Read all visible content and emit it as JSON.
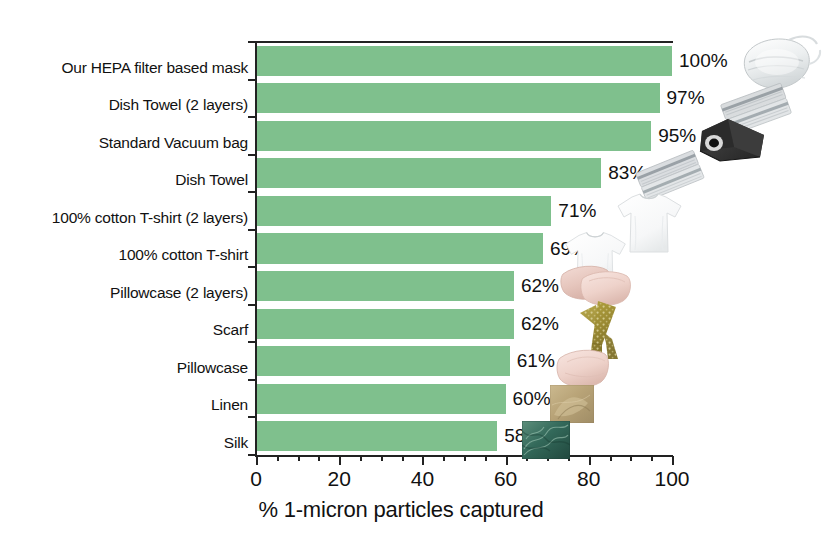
{
  "chart_data": {
    "type": "bar",
    "orientation": "horizontal",
    "title": "",
    "xlabel": "% 1-micron particles captured",
    "ylabel": "",
    "xlim": [
      0,
      100
    ],
    "xticks": [
      0,
      20,
      40,
      60,
      80,
      100
    ],
    "xtick_labels": [
      "0",
      "20",
      "40",
      "60",
      "80",
      "100"
    ],
    "minor_tick_step": 5,
    "grid": false,
    "legend": false,
    "bar_color": "#7fc08d",
    "categories": [
      "Our HEPA filter based mask",
      "Dish Towel (2 layers)",
      "Standard Vacuum bag",
      "Dish Towel",
      "100% cotton T-shirt (2 layers)",
      "100% cotton T-shirt",
      "Pillowcase (2 layers)",
      "Scarf",
      "Pillowcase",
      "Linen",
      "Silk"
    ],
    "values": [
      100,
      97,
      95,
      83,
      71,
      69,
      62,
      62,
      61,
      60,
      58
    ],
    "data_labels": [
      "100%",
      "97%",
      "95%",
      "83%",
      "71%",
      "69%",
      "62%",
      "62%",
      "61%",
      "60%",
      "58%"
    ]
  },
  "thumbnails": [
    {
      "name": "hepa-mask-thumbnail",
      "category": "Our HEPA filter based mask"
    },
    {
      "name": "dish-towel-two-layer-thumbnail",
      "category": "Dish Towel (2 layers)"
    },
    {
      "name": "vacuum-bag-thumbnail",
      "category": "Standard Vacuum bag"
    },
    {
      "name": "dish-towel-thumbnail",
      "category": "Dish Towel"
    },
    {
      "name": "cotton-tshirt-two-layer-thumbnail",
      "category": "100% cotton T-shirt (2 layers)"
    },
    {
      "name": "cotton-tshirt-thumbnail",
      "category": "100% cotton T-shirt"
    },
    {
      "name": "pillowcase-two-layer-thumbnail",
      "category": "Pillowcase (2 layers)"
    },
    {
      "name": "scarf-thumbnail",
      "category": "Scarf"
    },
    {
      "name": "pillowcase-thumbnail",
      "category": "Pillowcase"
    },
    {
      "name": "linen-swatch-thumbnail",
      "category": "Linen"
    },
    {
      "name": "silk-swatch-thumbnail",
      "category": "Silk"
    }
  ]
}
